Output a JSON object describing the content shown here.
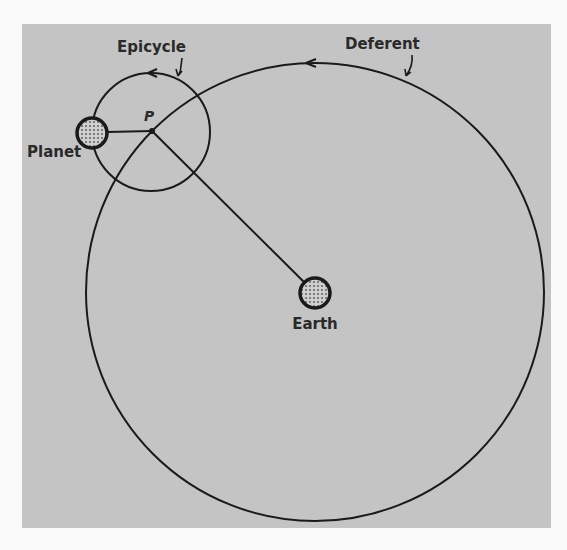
{
  "diagram": {
    "colors": {
      "page": "#fafafa",
      "panel": "#c4c4c4",
      "stroke": "#1a1a1a",
      "body_fill": "#8a8a8a"
    },
    "labels": {
      "epicycle": "Epicycle",
      "deferent": "Deferent",
      "planet": "Planet",
      "point_p": "P",
      "earth": "Earth"
    },
    "elements": {
      "deferent_circle": {
        "cx": 315,
        "cy": 292,
        "r": 229
      },
      "epicycle_circle": {
        "cx": 151,
        "cy": 132,
        "r": 59
      },
      "earth": {
        "cx": 315,
        "cy": 293,
        "r": 15
      },
      "planet": {
        "cx": 92,
        "cy": 133,
        "r": 15
      },
      "point_p": {
        "cx": 152,
        "cy": 131
      }
    }
  }
}
